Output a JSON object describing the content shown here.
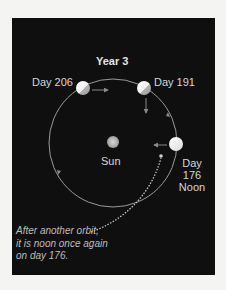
{
  "diagram": {
    "title": "Year 3",
    "sun_label": "Sun",
    "positions": [
      {
        "label": "Day 206"
      },
      {
        "label": "Day 191"
      },
      {
        "label_lines": [
          "Day",
          "176",
          "Noon"
        ]
      }
    ],
    "caption_lines": [
      "After another orbit,",
      "it is noon once again",
      "on day 176."
    ],
    "colors": {
      "background": "#0f0f0f",
      "orbit": "#9a9a9a",
      "planet_lit": "#f4f4f4",
      "planet_shadow": "#a8a8a8",
      "sun": "#bcbcbc",
      "text": "#d6d6d6"
    }
  }
}
